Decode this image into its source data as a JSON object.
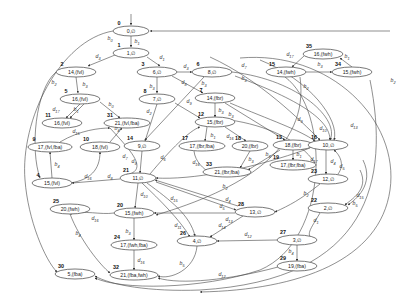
{
  "diagram": {
    "type": "state-transition-graph",
    "nodes": [
      {
        "id": "0",
        "label": "0,∅",
        "x": 131,
        "y": 31,
        "rx": 18,
        "ry": 5
      },
      {
        "id": "1",
        "label": "1,∅",
        "x": 131,
        "y": 53,
        "rx": 18,
        "ry": 5
      },
      {
        "id": "2",
        "label": "14,(fvl)",
        "x": 76,
        "y": 72,
        "rx": 20,
        "ry": 5
      },
      {
        "id": "3",
        "label": "6,∅",
        "x": 157,
        "y": 72,
        "rx": 20,
        "ry": 5
      },
      {
        "id": "5",
        "label": "16,(fvl)",
        "x": 80,
        "y": 99,
        "rx": 20,
        "ry": 5
      },
      {
        "id": "6",
        "label": "8,∅",
        "x": 212,
        "y": 72,
        "rx": 20,
        "ry": 5
      },
      {
        "id": "7",
        "label": "14,(fbr)",
        "x": 215,
        "y": 98,
        "rx": 20,
        "ry": 5
      },
      {
        "id": "8",
        "label": "7,∅",
        "x": 157,
        "y": 99,
        "rx": 18,
        "ry": 5
      },
      {
        "id": "9",
        "label": "17,(fvl,fba)",
        "x": 50,
        "y": 147,
        "rx": 22,
        "ry": 5
      },
      {
        "id": "10",
        "label": "18,(fvl)",
        "x": 100,
        "y": 147,
        "rx": 20,
        "ry": 5
      },
      {
        "id": "11",
        "label": "16,(fvl)",
        "x": 62,
        "y": 123,
        "rx": 20,
        "ry": 5
      },
      {
        "id": "31",
        "label": "21,(fvl,fba)",
        "x": 127,
        "y": 123,
        "rx": 23,
        "ry": 5
      },
      {
        "id": "12",
        "label": "15,(fbr)",
        "x": 215,
        "y": 122,
        "rx": 20,
        "ry": 5
      },
      {
        "id": "13",
        "label": "18,(fbr)",
        "x": 293,
        "y": 145,
        "rx": 20,
        "ry": 5
      },
      {
        "id": "14",
        "label": "9,∅",
        "x": 142,
        "y": 146,
        "rx": 18,
        "ry": 5
      },
      {
        "id": "15",
        "label": "14,(fwh)",
        "x": 286,
        "y": 72,
        "rx": 20,
        "ry": 5
      },
      {
        "id": "16",
        "label": "10,∅",
        "x": 328,
        "y": 145,
        "rx": 20,
        "ry": 5
      },
      {
        "id": "17",
        "label": "17,(fbr,fba)",
        "x": 202,
        "y": 146,
        "rx": 23,
        "ry": 5
      },
      {
        "id": "18",
        "label": "20,(fbr)",
        "x": 250,
        "y": 146,
        "rx": 18,
        "ry": 5
      },
      {
        "id": "19",
        "label": "17,(fbr,fba)",
        "x": 293,
        "y": 165,
        "rx": 23,
        "ry": 5
      },
      {
        "id": "21",
        "label": "11,∅",
        "x": 138,
        "y": 178,
        "rx": 18,
        "ry": 5
      },
      {
        "id": "23",
        "label": "12,∅",
        "x": 328,
        "y": 179,
        "rx": 20,
        "ry": 5
      },
      {
        "id": "4",
        "label": "15,(fvl)",
        "x": 52,
        "y": 183,
        "rx": 20,
        "ry": 5
      },
      {
        "id": "22",
        "label": "2,∅",
        "x": 328,
        "y": 208,
        "rx": 20,
        "ry": 5
      },
      {
        "id": "25",
        "label": "20,(fwh)",
        "x": 70,
        "y": 209,
        "rx": 20,
        "ry": 5
      },
      {
        "id": "20",
        "label": "15,(fwh)",
        "x": 134,
        "y": 213,
        "rx": 20,
        "ry": 5
      },
      {
        "id": "28",
        "label": "13,∅",
        "x": 255,
        "y": 212,
        "rx": 20,
        "ry": 5
      },
      {
        "id": "24",
        "label": "17,(fwh,fba)",
        "x": 134,
        "y": 245,
        "rx": 23,
        "ry": 5
      },
      {
        "id": "26",
        "label": "4,∅",
        "x": 197,
        "y": 241,
        "rx": 20,
        "ry": 5
      },
      {
        "id": "27",
        "label": "3,∅",
        "x": 297,
        "y": 240,
        "rx": 20,
        "ry": 5
      },
      {
        "id": "29",
        "label": "19,(fba)",
        "x": 297,
        "y": 266,
        "rx": 20,
        "ry": 5
      },
      {
        "id": "30",
        "label": "5,(fba)",
        "x": 75,
        "y": 274,
        "rx": 20,
        "ry": 5
      },
      {
        "id": "32",
        "label": "21,(fba,fwh)",
        "x": 134,
        "y": 275,
        "rx": 24,
        "ry": 5
      },
      {
        "id": "33",
        "label": "21,(fbr,fba)",
        "x": 227,
        "y": 172,
        "rx": 24,
        "ry": 5
      },
      {
        "id": "34",
        "label": "15,(fwh)",
        "x": 352,
        "y": 72,
        "rx": 20,
        "ry": 5
      },
      {
        "id": "35",
        "label": "16,(fwh)",
        "x": 323,
        "y": 54,
        "rx": 20,
        "ry": 5
      }
    ],
    "edges": [
      {
        "label": "",
        "d": "M131,14 L131,25"
      },
      {
        "label": "b1",
        "d": "M131,36 L131,47",
        "lx": 137,
        "ly": 43
      },
      {
        "label": "b0",
        "d": "M113,31 C60,40 20,120 25,180 C28,220 45,260 57,272",
        "lx": 110,
        "ly": 40
      },
      {
        "label": "d3",
        "d": "M115,55 L88,66",
        "lx": 98,
        "ly": 58
      },
      {
        "label": "d1",
        "d": "M147,57 L160,66",
        "lx": 162,
        "ly": 59
      },
      {
        "label": "b3",
        "d": "M76,77 L78,93",
        "lx": 85,
        "ly": 86
      },
      {
        "label": "b2",
        "d": "M56,72 C35,90 30,150 40,178",
        "lx": 54,
        "ly": 84
      },
      {
        "label": "d3",
        "d": "M177,72 L192,72",
        "lx": 186,
        "ly": 68
      },
      {
        "label": "b3",
        "d": "M157,77 L157,93",
        "lx": 152,
        "ly": 88
      },
      {
        "label": "d8",
        "d": "M172,76 L203,93",
        "lx": 184,
        "ly": 84
      },
      {
        "label": "b3",
        "d": "M204,77 L145,140",
        "lx": 204,
        "ly": 85
      },
      {
        "label": "d7",
        "d": "M232,72 C300,80 340,120 330,140",
        "lx": 244,
        "ly": 67
      },
      {
        "label": "b3",
        "d": "M235,76 C300,100 330,120 330,140",
        "lx": 244,
        "ly": 80
      },
      {
        "label": "d17",
        "d": "M80,104 L66,118",
        "lx": 56,
        "ly": 111
      },
      {
        "label": "b1",
        "d": "M84,104 L70,118",
        "lx": 76,
        "ly": 111
      },
      {
        "label": "b0",
        "d": "M100,102 L120,118",
        "lx": 111,
        "ly": 106
      },
      {
        "label": "b3",
        "d": "M215,103 L215,117",
        "lx": 221,
        "ly": 112
      },
      {
        "label": "b3",
        "d": "M225,103 L285,140",
        "lx": 231,
        "ly": 116
      },
      {
        "label": "d9",
        "d": "M175,103 L200,118",
        "lx": 189,
        "ly": 103
      },
      {
        "label": "d2",
        "d": "M157,104 L145,141",
        "lx": 149,
        "ly": 113
      },
      {
        "label": "d15",
        "d": "M60,142 C80,130 100,128 110,128",
        "lx": 76,
        "ly": 133
      },
      {
        "label": "b4",
        "d": "M110,142 L122,128",
        "lx": 117,
        "ly": 130
      },
      {
        "label": "b4",
        "d": "M52,178 L50,152",
        "lx": 57,
        "ly": 166
      },
      {
        "label": "d16",
        "d": "M70,183 C90,180 100,170 100,152",
        "lx": 88,
        "ly": 178
      },
      {
        "label": "d8",
        "d": "M120,179 L72,183",
        "lx": 110,
        "ly": 178
      },
      {
        "label": "d7",
        "d": "M110,128 C130,150 150,170 126,175",
        "lx": 125,
        "ly": 158
      },
      {
        "label": "d9",
        "d": "M142,151 L140,173",
        "lx": 134,
        "ly": 163
      },
      {
        "label": "d6",
        "d": "M150,174 C170,150 190,130 200,127",
        "lx": 163,
        "ly": 159
      },
      {
        "label": "b1",
        "d": "M207,127 L205,141",
        "lx": 213,
        "ly": 137
      },
      {
        "label": "d16",
        "d": "M225,127 L246,141",
        "lx": 230,
        "ly": 138
      },
      {
        "label": "d16",
        "d": "M194,151 C195,162 205,170 208,171",
        "lx": 196,
        "ly": 164
      },
      {
        "label": "b3",
        "d": "M250,151 L240,168",
        "lx": 251,
        "ly": 161
      },
      {
        "label": "b3",
        "d": "M280,150 L248,170",
        "lx": 268,
        "ly": 156
      },
      {
        "label": "b1",
        "d": "M293,150 L293,160",
        "lx": 299,
        "ly": 156
      },
      {
        "label": "d17",
        "d": "M315,163 C300,140 265,125 230,120",
        "lx": 314,
        "ly": 161
      },
      {
        "label": "d9",
        "d": "M210,57 C260,80 300,120 320,140",
        "lx": 300,
        "ly": 121
      },
      {
        "label": "d10",
        "d": "M230,103 C270,120 300,130 315,141",
        "lx": 323,
        "ly": 130
      },
      {
        "label": "d13",
        "d": "M260,60 C310,80 340,120 334,140",
        "lx": 354,
        "ly": 127
      },
      {
        "label": "d4",
        "d": "M326,150 L326,174",
        "lx": 333,
        "ly": 163
      },
      {
        "label": "d5",
        "d": "M338,174 C345,165 340,155 334,150",
        "lx": 342,
        "ly": 168
      },
      {
        "label": "d15",
        "d": "M360,170 C370,190 350,200 345,205",
        "lx": 360,
        "ly": 197
      },
      {
        "label": "b5",
        "d": "M363,160 C375,185 355,200 348,205",
        "lx": 355,
        "ly": 205
      },
      {
        "label": "b2",
        "d": "M320,184 C300,200 290,205 275,212",
        "lx": 306,
        "ly": 195
      },
      {
        "label": "b2",
        "d": "M310,148 C250,170 190,180 156,178",
        "lx": 225,
        "ly": 188
      },
      {
        "label": "d1",
        "d": "M320,213 C310,230 305,235 314,240",
        "lx": 316,
        "ly": 222
      },
      {
        "label": "b4",
        "d": "M297,245 L297,261",
        "lx": 291,
        "ly": 253
      },
      {
        "label": "d12",
        "d": "M277,240 L217,241",
        "lx": 248,
        "ly": 236
      },
      {
        "label": "d4",
        "d": "M238,206 L155,180",
        "lx": 228,
        "ly": 201
      },
      {
        "label": "d5",
        "d": "M156,182 L236,210",
        "lx": 222,
        "ly": 208
      },
      {
        "label": "d13",
        "d": "M235,213 L154,213",
        "lx": 229,
        "ly": 221
      },
      {
        "label": "d14",
        "d": "M243,216 L210,237",
        "lx": 222,
        "ly": 227
      },
      {
        "label": "d10",
        "d": "M138,183 L135,208",
        "lx": 144,
        "ly": 196
      },
      {
        "label": "d15",
        "d": "M147,183 C170,200 190,215 195,236",
        "lx": 174,
        "ly": 200
      },
      {
        "label": "d11",
        "d": "M142,183 C160,200 180,220 190,237",
        "lx": 178,
        "ly": 227
      },
      {
        "label": "d16",
        "d": "M114,213 C100,215 85,210 70,214",
        "lx": 95,
        "ly": 220
      },
      {
        "label": "b3",
        "d": "M134,218 L134,240",
        "lx": 128,
        "ly": 233
      },
      {
        "label": "d16",
        "d": "M134,250 L134,270",
        "lx": 141,
        "ly": 262
      },
      {
        "label": "b4",
        "d": "M70,214 C80,240 100,265 110,273",
        "lx": 78,
        "ly": 235
      },
      {
        "label": "b5",
        "d": "M197,246 C195,270 170,280 158,276",
        "lx": 182,
        "ly": 265
      },
      {
        "label": "d12",
        "d": "M278,267 C230,280 180,285 158,278",
        "lx": 222,
        "ly": 276
      },
      {
        "label": "b2",
        "d": "M370,80 C390,180 370,280 200,290 C150,292 110,285 95,276",
        "lx": 393,
        "ly": 82
      },
      {
        "label": "",
        "d": "M285,77 C330,110 330,240 260,270 C200,290 120,290 95,278"
      },
      {
        "label": "",
        "d": "M240,58 C330,50 400,120 390,190 C380,260 300,290 200,292"
      },
      {
        "label": "b2",
        "d": "M300,77 C310,150 240,190 156,215",
        "lx": 306,
        "ly": 88
      },
      {
        "label": "b3",
        "d": "M306,72 L332,72",
        "lx": 320,
        "ly": 66
      },
      {
        "label": "b1",
        "d": "M352,67 L340,58",
        "lx": 347,
        "ly": 58
      },
      {
        "label": "d17",
        "d": "M304,56 L292,67",
        "lx": 290,
        "ly": 56
      },
      {
        "label": "",
        "d": "M390,31 L150,31"
      }
    ]
  }
}
